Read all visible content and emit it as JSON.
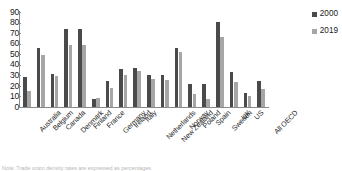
{
  "chart_data": {
    "type": "bar",
    "title": "",
    "xlabel": "",
    "ylabel": "",
    "ylim": [
      0,
      90
    ],
    "yticks": [
      0,
      10,
      20,
      30,
      40,
      50,
      60,
      70,
      80,
      90
    ],
    "grid": false,
    "legend_position": "top-right",
    "categories": [
      "Australia",
      "Belgium",
      "Canada",
      "Denmark",
      "Finland",
      "France",
      "Germany",
      "Ireland",
      "Italy",
      "Netherlands",
      "New Zealand",
      "Norway",
      "Poland",
      "Spain",
      "Sweden",
      "UK",
      "US",
      "All OECD"
    ],
    "series": [
      {
        "name": "2000",
        "color": "#4a4a4a",
        "values": [
          28,
          56,
          31,
          74,
          74,
          8,
          25,
          36,
          37,
          30,
          30,
          56,
          22,
          22,
          81,
          33,
          13,
          25
        ]
      },
      {
        "name": "2019",
        "color": "#a6a6a6",
        "values": [
          15,
          49,
          29,
          59,
          59,
          9,
          18,
          30,
          34,
          27,
          26,
          52,
          12,
          8,
          66,
          24,
          10,
          17
        ]
      }
    ]
  },
  "legend": {
    "items": [
      {
        "label": "2000",
        "color": "#4a4a4a"
      },
      {
        "label": "2019",
        "color": "#a6a6a6"
      }
    ]
  },
  "caption": {
    "text": "Note: Trade union density rates are expressed as percentages."
  },
  "colors": {
    "series_2000": "#4a4a4a",
    "series_2019": "#a6a6a6",
    "axis": "#8a8a8a",
    "text": "#1a1a1a"
  }
}
